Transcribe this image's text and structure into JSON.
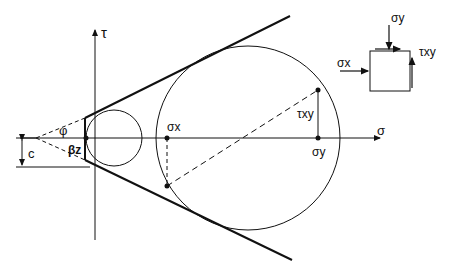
{
  "diagram": {
    "axes": {
      "horizontal_label": "σ",
      "vertical_label": "τ"
    },
    "labels": {
      "sigma_x": "σx",
      "sigma_y": "σy",
      "tau_xy": "τxy",
      "cohesion": "c",
      "friction_angle": "φ",
      "beta": "βz"
    },
    "element": {
      "sigma_x": "σx",
      "sigma_y": "σy",
      "tau_xy": "τxy"
    },
    "colors": {
      "line": "#111111",
      "background": "#ffffff"
    }
  }
}
